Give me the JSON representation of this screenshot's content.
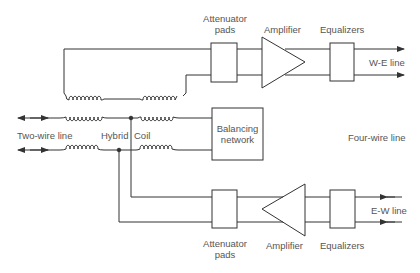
{
  "diagram": {
    "colors": {
      "line": "#333333",
      "text": "#555555",
      "background": "#ffffff"
    },
    "labels": {
      "two_wire_line": "Two-wire line",
      "hybrid": "Hybrid",
      "coil": "Coil",
      "four_wire_line": "Four-wire line",
      "we_line": "W-E line",
      "ew_line": "E-W line",
      "balancing_network_1": "Balancing",
      "balancing_network_2": "network"
    },
    "top_path": {
      "attenuator_1": "Attenuator",
      "attenuator_2": "pads",
      "amplifier": "Amplifier",
      "equalizers": "Equalizers"
    },
    "bottom_path": {
      "attenuator_1": "Attenuator",
      "attenuator_2": "pads",
      "amplifier": "Amplifier",
      "equalizers": "Equalizers"
    },
    "nodes": [
      "Two-wire line",
      "Hybrid coil",
      "Balancing network",
      "Attenuator pads (W-E)",
      "Amplifier (W-E)",
      "Equalizers (W-E)",
      "W-E line",
      "Attenuator pads (E-W)",
      "Amplifier (E-W)",
      "Equalizers (E-W)",
      "E-W line"
    ],
    "edges": [
      [
        "Two-wire line",
        "Hybrid coil"
      ],
      [
        "Hybrid coil",
        "Balancing network"
      ],
      [
        "Hybrid coil",
        "Attenuator pads (W-E)"
      ],
      [
        "Attenuator pads (W-E)",
        "Amplifier (W-E)"
      ],
      [
        "Amplifier (W-E)",
        "Equalizers (W-E)"
      ],
      [
        "Equalizers (W-E)",
        "W-E line"
      ],
      [
        "E-W line",
        "Equalizers (E-W)"
      ],
      [
        "Equalizers (E-W)",
        "Amplifier (E-W)"
      ],
      [
        "Amplifier (E-W)",
        "Attenuator pads (E-W)"
      ],
      [
        "Attenuator pads (E-W)",
        "Hybrid coil"
      ]
    ]
  }
}
